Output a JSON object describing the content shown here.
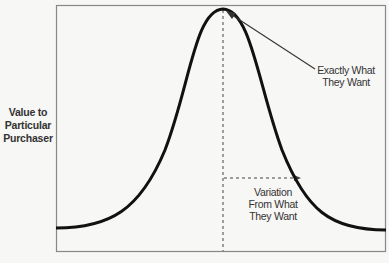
{
  "diagram": {
    "type": "bell-curve",
    "y_axis_label": [
      "Value to",
      "Particular",
      "Purchaser"
    ],
    "annotations": {
      "peak": [
        "Exactly What",
        "They Want"
      ],
      "variation": [
        "Variation",
        "From What",
        "They Want"
      ]
    },
    "colors": {
      "curve": "#111111",
      "frame": "#888888",
      "dashed": "#444444",
      "background": "#f7f7f5"
    }
  }
}
